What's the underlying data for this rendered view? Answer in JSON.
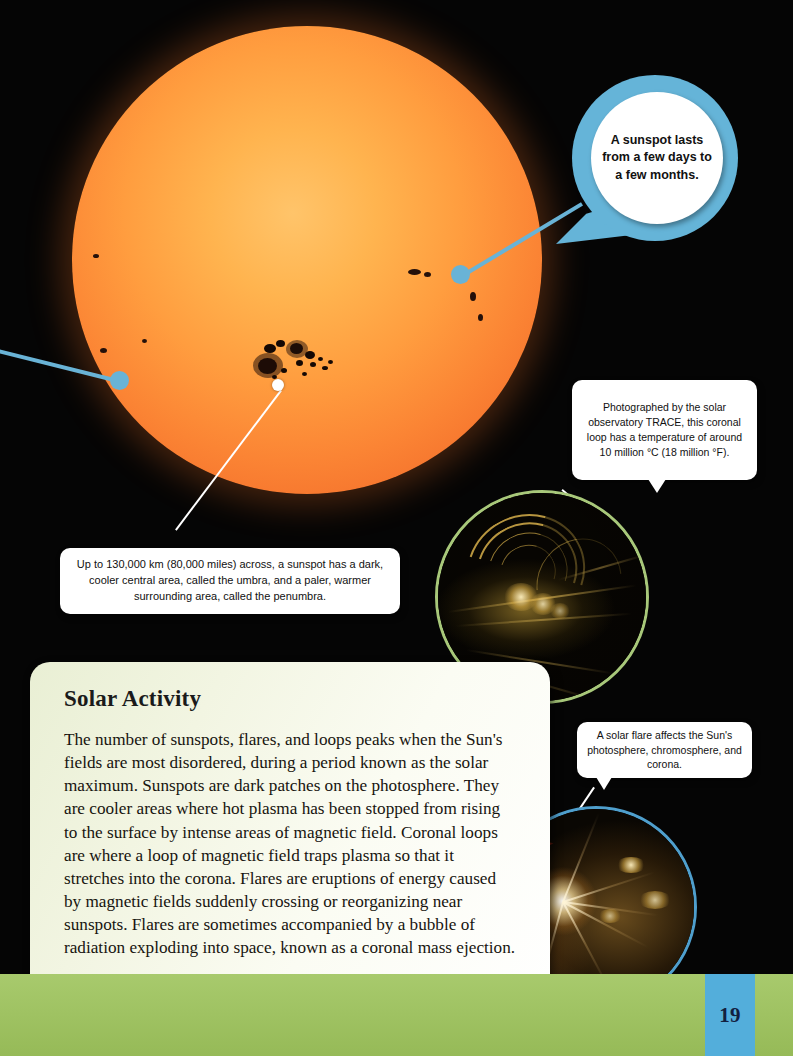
{
  "page": {
    "number": "19",
    "accent_blue": "#53aedb",
    "accent_green": "#9ec45c",
    "background": "#000000"
  },
  "sun_image": {
    "alt_name": "sun-photograph",
    "surface_color": "#ff9d3f"
  },
  "speech_bubble": {
    "name": "sunspot-duration-bubble",
    "text": "A sunspot lasts from a few days to a few months.",
    "ring_color": "#65b4d8"
  },
  "captions": [
    {
      "name": "trace-coronal-loop-caption",
      "text": "Photographed by the solar observatory TRACE, this coronal loop has a temperature of around 10 million °C (18 million °F)."
    },
    {
      "name": "sunspot-umbra-penumbra-caption",
      "text": "Up to 130,000 km (80,000 miles) across, a sunspot has a dark, cooler central area, called the umbra, and a paler, warmer surrounding area, called the penumbra."
    },
    {
      "name": "solar-flare-caption",
      "text": "A solar flare affects the Sun's photosphere, chromosphere, and corona."
    }
  ],
  "photos": [
    {
      "name": "coronal-loop-photo",
      "ring_color": "#a8c87a"
    },
    {
      "name": "solar-flare-photo",
      "ring_color": "#4f9fcd"
    }
  ],
  "panel": {
    "heading": "Solar Activity",
    "body": "The number of sunspots, flares, and loops peaks when the Sun's fields are most disordered, during a period known as the solar maximum. Sunspots are dark patches on the photosphere. They are cooler areas where hot plasma has been stopped from rising to the surface by intense areas of magnetic field. Coronal loops are where a loop of magnetic field traps plasma so that it stretches into the corona. Flares are eruptions of energy caused by magnetic fields suddenly crossing or reorganizing near sunspots. Flares are sometimes accompanied by a bubble of radiation exploding into space, known as a coronal mass ejection."
  }
}
